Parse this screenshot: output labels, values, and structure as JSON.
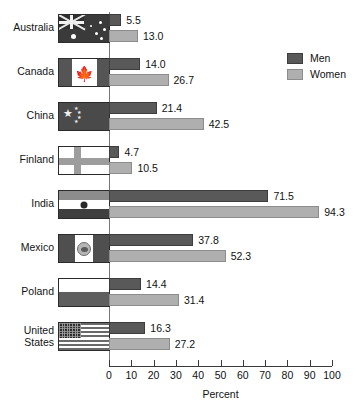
{
  "chart_data": {
    "type": "bar",
    "orientation": "horizontal",
    "title": "",
    "xlabel": "Percent",
    "ylabel": "",
    "xlim": [
      0,
      100
    ],
    "xticks": [
      0,
      10,
      20,
      30,
      40,
      50,
      60,
      70,
      80,
      90,
      100
    ],
    "grid": false,
    "legend_position": "top-right",
    "categories": [
      "Australia",
      "Canada",
      "China",
      "Finland",
      "India",
      "Mexico",
      "Poland",
      "United States"
    ],
    "series": [
      {
        "name": "Men",
        "color": "#595959",
        "values": [
          5.5,
          14.0,
          21.4,
          4.7,
          71.5,
          37.8,
          14.4,
          16.3
        ]
      },
      {
        "name": "Women",
        "color": "#afafaf",
        "values": [
          13.0,
          26.7,
          42.5,
          10.5,
          94.3,
          52.3,
          31.4,
          27.2
        ]
      }
    ],
    "value_labels": {
      "Men": [
        "5.5",
        "14.0",
        "21.4",
        "4.7",
        "71.5",
        "37.8",
        "14.4",
        "16.3"
      ],
      "Women": [
        "13.0",
        "26.7",
        "42.5",
        "10.5",
        "94.3",
        "52.3",
        "31.4",
        "27.2"
      ]
    }
  },
  "rows": [
    {
      "label": "Australia",
      "flag": "flag-australia",
      "flag_name": "flag-icon-australia",
      "men": "5.5",
      "women": "13.0"
    },
    {
      "label": "Canada",
      "flag": "flag-canada",
      "flag_name": "flag-icon-canada",
      "men": "14.0",
      "women": "26.7"
    },
    {
      "label": "China",
      "flag": "flag-china",
      "flag_name": "flag-icon-china",
      "men": "21.4",
      "women": "42.5"
    },
    {
      "label": "Finland",
      "flag": "flag-finland",
      "flag_name": "flag-icon-finland",
      "men": "4.7",
      "women": "10.5"
    },
    {
      "label": "India",
      "flag": "flag-india",
      "flag_name": "flag-icon-india",
      "men": "71.5",
      "women": "94.3"
    },
    {
      "label": "Mexico",
      "flag": "flag-mexico",
      "flag_name": "flag-icon-mexico",
      "men": "37.8",
      "women": "52.3"
    },
    {
      "label": "Poland",
      "flag": "flag-poland",
      "flag_name": "flag-icon-poland",
      "men": "14.4",
      "women": "31.4"
    },
    {
      "label": "United\nStates",
      "flag": "flag-us",
      "flag_name": "flag-icon-united-states",
      "men": "16.3",
      "women": "27.2"
    }
  ],
  "legend": {
    "items": [
      {
        "label": "Men",
        "swatch": "men"
      },
      {
        "label": "Women",
        "swatch": "women"
      }
    ]
  },
  "axis": {
    "title": "Percent",
    "ticks": [
      "0",
      "10",
      "20",
      "30",
      "40",
      "50",
      "60",
      "70",
      "80",
      "90",
      "100"
    ]
  }
}
